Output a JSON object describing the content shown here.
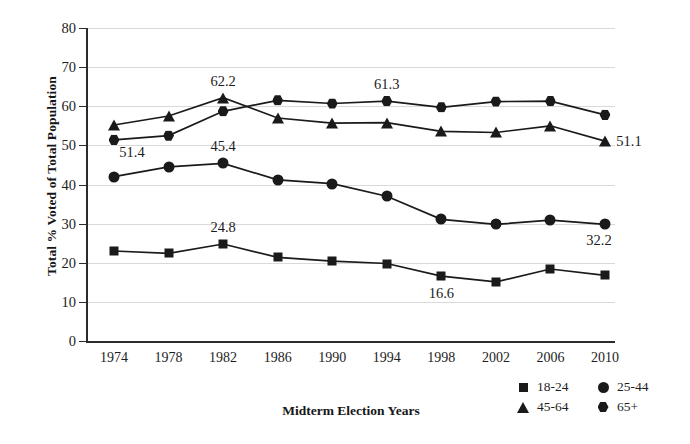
{
  "chart_data": {
    "type": "line",
    "title": "",
    "xlabel": "Midterm Election Years",
    "ylabel": "Total % Voted of Total Population",
    "categories": [
      "1974",
      "1978",
      "1982",
      "1986",
      "1990",
      "1994",
      "1998",
      "2002",
      "2006",
      "2010"
    ],
    "ylim": [
      0,
      80
    ],
    "ytick_labels": [
      "0",
      "10",
      "20",
      "30",
      "40",
      "50",
      "60",
      "70",
      "80"
    ],
    "ytick_values": [
      0,
      10,
      20,
      30,
      40,
      50,
      60,
      70,
      80
    ],
    "grid": true,
    "legend_position": "bottom-right",
    "series": [
      {
        "name": "18-24",
        "marker": "square",
        "color": "#1a1a1a",
        "values": [
          23.0,
          22.4,
          24.8,
          21.4,
          20.4,
          19.8,
          16.6,
          15.1,
          18.4,
          16.8
        ]
      },
      {
        "name": "25-44",
        "marker": "circle",
        "color": "#1a1a1a",
        "values": [
          42.0,
          44.5,
          45.4,
          41.2,
          40.2,
          37.0,
          31.1,
          29.8,
          30.9,
          29.8
        ]
      },
      {
        "name": "45-64",
        "marker": "triangle",
        "color": "#1a1a1a",
        "values": [
          55.2,
          57.5,
          62.2,
          57.0,
          55.7,
          55.8,
          53.6,
          53.3,
          55.0,
          51.1
        ]
      },
      {
        "name": "65+",
        "marker": "hexagon",
        "color": "#1a1a1a",
        "values": [
          51.4,
          52.5,
          58.7,
          61.5,
          60.7,
          61.3,
          59.7,
          61.2,
          61.3,
          57.8
        ]
      }
    ],
    "point_labels": [
      {
        "text": "51.4",
        "series": "65+",
        "category": "1974",
        "dx": 18,
        "dy": 12
      },
      {
        "text": "62.2",
        "series": "45-64",
        "category": "1982",
        "dx": 0,
        "dy": -17
      },
      {
        "text": "45.4",
        "series": "25-44",
        "category": "1982",
        "dx": 0,
        "dy": -17
      },
      {
        "text": "24.8",
        "series": "18-24",
        "category": "1982",
        "dx": 0,
        "dy": -17
      },
      {
        "text": "61.3",
        "series": "65+",
        "category": "1994",
        "dx": 0,
        "dy": -17
      },
      {
        "text": "51.1",
        "series": "45-64",
        "category": "2010",
        "dx": 24,
        "dy": 0
      },
      {
        "text": "32.2",
        "series": "25-44",
        "category": "2010",
        "dx": -6,
        "dy": 16
      },
      {
        "text": "16.6",
        "series": "18-24",
        "category": "1998",
        "dx": 0,
        "dy": 17
      }
    ]
  },
  "legend": {
    "rows": [
      [
        {
          "label": "18-24",
          "marker": "square"
        },
        {
          "label": "25-44",
          "marker": "circle"
        }
      ],
      [
        {
          "label": "45-64",
          "marker": "triangle"
        },
        {
          "label": "65+",
          "marker": "hexagon"
        }
      ]
    ]
  },
  "caption": ""
}
